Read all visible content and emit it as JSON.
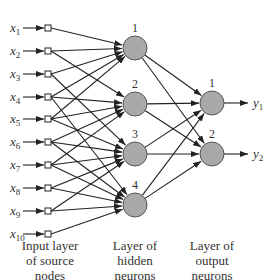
{
  "diagram": {
    "type": "feedforward-neural-network",
    "colors": {
      "neuron_fill": "#a9a9a9",
      "neuron_stroke": "#555555",
      "line": "#222222",
      "text": "#333333",
      "background": "#ffffff"
    },
    "input_nodes": [
      {
        "label": "x",
        "sub": "1",
        "y": 28
      },
      {
        "label": "x",
        "sub": "2",
        "y": 51
      },
      {
        "label": "x",
        "sub": "3",
        "y": 74
      },
      {
        "label": "x",
        "sub": "4",
        "y": 97
      },
      {
        "label": "x",
        "sub": "5",
        "y": 119
      },
      {
        "label": "x",
        "sub": "6",
        "y": 142
      },
      {
        "label": "x",
        "sub": "7",
        "y": 165
      },
      {
        "label": "x",
        "sub": "8",
        "y": 188
      },
      {
        "label": "x",
        "sub": "9",
        "y": 211
      },
      {
        "label": "x",
        "sub": "10",
        "y": 234
      }
    ],
    "hidden_neurons": [
      {
        "label": "1",
        "y": 48
      },
      {
        "label": "2",
        "y": 104
      },
      {
        "label": "3",
        "y": 154
      },
      {
        "label": "4",
        "y": 205
      }
    ],
    "output_neurons": [
      {
        "label": "1",
        "y": 103,
        "out_label": "y",
        "out_sub": "1"
      },
      {
        "label": "2",
        "y": 154,
        "out_label": "y",
        "out_sub": "2"
      }
    ],
    "input_to_hidden": [
      [
        0,
        0
      ],
      [
        1,
        0
      ],
      [
        1,
        1
      ],
      [
        2,
        0
      ],
      [
        2,
        2
      ],
      [
        3,
        0
      ],
      [
        3,
        1
      ],
      [
        3,
        3
      ],
      [
        4,
        0
      ],
      [
        4,
        1
      ],
      [
        4,
        2
      ],
      [
        5,
        1
      ],
      [
        5,
        2
      ],
      [
        5,
        3
      ],
      [
        6,
        1
      ],
      [
        6,
        2
      ],
      [
        6,
        3
      ],
      [
        7,
        2
      ],
      [
        7,
        3
      ],
      [
        8,
        2
      ],
      [
        8,
        3
      ],
      [
        9,
        3
      ]
    ],
    "hidden_to_output": [
      [
        0,
        0
      ],
      [
        0,
        1
      ],
      [
        1,
        0
      ],
      [
        1,
        1
      ],
      [
        2,
        0
      ],
      [
        2,
        1
      ],
      [
        3,
        0
      ],
      [
        3,
        1
      ]
    ],
    "captions": {
      "input": [
        "Input layer",
        "of source",
        "nodes"
      ],
      "hidden": [
        "Layer of",
        "hidden",
        "neurons"
      ],
      "output": [
        "Layer of",
        "output",
        "neurons"
      ]
    }
  }
}
